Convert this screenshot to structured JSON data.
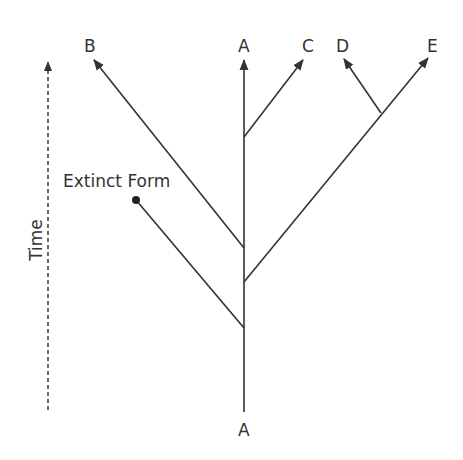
{
  "diagram": {
    "type": "phylogenetic-tree",
    "axis_label": "Time",
    "root_label": "A",
    "extinct_label": "Extinct Form",
    "tips": [
      {
        "id": "B",
        "label": "B"
      },
      {
        "id": "A",
        "label": "A"
      },
      {
        "id": "C",
        "label": "C"
      },
      {
        "id": "D",
        "label": "D"
      },
      {
        "id": "E",
        "label": "E"
      }
    ],
    "line_color": "#333333"
  }
}
